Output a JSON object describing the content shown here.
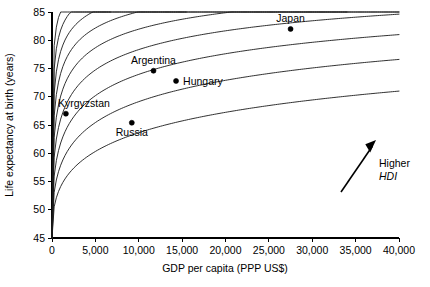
{
  "chart_data": {
    "type": "scatter",
    "title": "",
    "xlabel": "GDP per capita (PPP US$)",
    "ylabel": "Life expectancy at birth (years)",
    "xlim": [
      0,
      40000
    ],
    "ylim": [
      45,
      85
    ],
    "grid": false,
    "legend": null,
    "xticks": [
      {
        "value": 0,
        "label": "0"
      },
      {
        "value": 5000,
        "label": "5,000"
      },
      {
        "value": 10000,
        "label": "10,000"
      },
      {
        "value": 15000,
        "label": "15,000"
      },
      {
        "value": 20000,
        "label": "20,000"
      },
      {
        "value": 25000,
        "label": "25,000"
      },
      {
        "value": 30000,
        "label": "30,000"
      },
      {
        "value": 35000,
        "label": "35,000"
      },
      {
        "value": 40000,
        "label": "40,000"
      }
    ],
    "yticks": [
      {
        "value": 45,
        "label": "45"
      },
      {
        "value": 50,
        "label": "50"
      },
      {
        "value": 55,
        "label": "55"
      },
      {
        "value": 60,
        "label": "60"
      },
      {
        "value": 65,
        "label": "65"
      },
      {
        "value": 70,
        "label": "70"
      },
      {
        "value": 75,
        "label": "75"
      },
      {
        "value": 80,
        "label": "80"
      },
      {
        "value": 85,
        "label": "85"
      }
    ],
    "points": [
      {
        "name": "Kyrgyzstan",
        "x": 1600,
        "y": 67.0,
        "label": "Kyrgyzstan",
        "label_pos": "above-right"
      },
      {
        "name": "Argentina",
        "x": 11700,
        "y": 74.6,
        "label": "Argentina",
        "label_pos": "above"
      },
      {
        "name": "Hungary",
        "x": 14300,
        "y": 72.8,
        "label": "Hungary",
        "label_pos": "right"
      },
      {
        "name": "Russia",
        "x": 9200,
        "y": 65.4,
        "label": "Russia",
        "label_pos": "below"
      },
      {
        "name": "Japan",
        "x": 27500,
        "y": 82.0,
        "label": "Japan",
        "label_pos": "above"
      }
    ],
    "iso_curves": {
      "description": "Iso-HDI hyperbolic contour curves; higher curves indicate higher HDI",
      "count": 9,
      "k_values": [
        1.0,
        1.55,
        2.25,
        3.2,
        4.4,
        6.0,
        8.2,
        11.4,
        16.0
      ]
    },
    "annotations": [
      {
        "name": "higher-hdi",
        "line1": "Higher",
        "line2": "HDI",
        "arrow_from": {
          "x": 33000,
          "y": 52.0
        },
        "arrow_to": {
          "x": 37100,
          "y": 60.5
        }
      }
    ]
  },
  "colors": {
    "axis": "#000000",
    "curve": "#1a1a1a",
    "point": "#000000",
    "background": "#ffffff"
  }
}
